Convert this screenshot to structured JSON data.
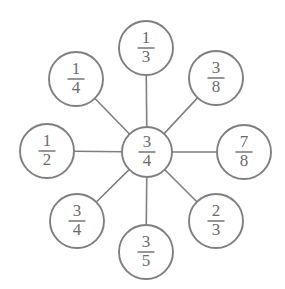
{
  "diagram": {
    "type": "radial-fraction-web",
    "background_color": "#ffffff",
    "stroke_color": "#7f7f7f",
    "text_color": "#6b6b6b",
    "center": {
      "id": "center",
      "label": "3/4",
      "numerator": "3",
      "denominator": "4",
      "cx": 147,
      "cy": 152,
      "r": 25
    },
    "nodes": [
      {
        "id": "top",
        "position": "top",
        "label": "1/3",
        "numerator": "1",
        "denominator": "3",
        "cx": 146,
        "cy": 48,
        "r": 27
      },
      {
        "id": "top-left",
        "position": "top-left",
        "label": "1/4",
        "numerator": "1",
        "denominator": "4",
        "cx": 76,
        "cy": 79,
        "r": 27
      },
      {
        "id": "top-right",
        "position": "top-right",
        "label": "3/8",
        "numerator": "3",
        "denominator": "8",
        "cx": 216,
        "cy": 78,
        "r": 27
      },
      {
        "id": "left",
        "position": "left",
        "label": "1/2",
        "numerator": "1",
        "denominator": "2",
        "cx": 47,
        "cy": 151,
        "r": 27
      },
      {
        "id": "right",
        "position": "right",
        "label": "7/8",
        "numerator": "7",
        "denominator": "8",
        "cx": 244,
        "cy": 152,
        "r": 27
      },
      {
        "id": "bottom-left",
        "position": "bottom-left",
        "label": "3/4",
        "numerator": "3",
        "denominator": "4",
        "cx": 77,
        "cy": 221,
        "r": 27
      },
      {
        "id": "bottom",
        "position": "bottom",
        "label": "3/5",
        "numerator": "3",
        "denominator": "5",
        "cx": 146,
        "cy": 252,
        "r": 27
      },
      {
        "id": "bottom-right",
        "position": "bottom-right",
        "label": "2/3",
        "numerator": "2",
        "denominator": "3",
        "cx": 216,
        "cy": 221,
        "r": 27
      }
    ]
  }
}
